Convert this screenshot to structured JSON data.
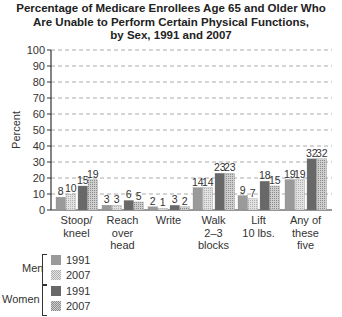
{
  "chart_data": {
    "type": "bar",
    "title": "Percentage of Medicare Enrollees Age 65 and Older Who Are Unable to Perform Certain Physical Functions, by Sex, 1991 and 2007",
    "title_lines": [
      "Percentage of Medicare Enrollees Age 65 and Older Who",
      "Are Unable to Perform Certain Physical Functions,",
      "by Sex, 1991 and 2007"
    ],
    "xlabel": "",
    "ylabel": "Percent",
    "ylim": [
      0,
      100
    ],
    "yticks": [
      0,
      10,
      20,
      30,
      40,
      50,
      60,
      70,
      80,
      90,
      100
    ],
    "grid": true,
    "categories": [
      "Stoop/kneel",
      "Reach over head",
      "Write",
      "Walk 2–3 blocks",
      "Lift 10 lbs.",
      "Any of these five"
    ],
    "category_lines": [
      [
        "Stoop/",
        "kneel"
      ],
      [
        "Reach",
        "over",
        "head"
      ],
      [
        "Write"
      ],
      [
        "Walk",
        "2–3",
        "blocks"
      ],
      [
        "Lift",
        "10 lbs."
      ],
      [
        "Any of",
        "these",
        "five"
      ]
    ],
    "series": [
      {
        "name": "Men 1991",
        "group": "Men",
        "year": "1991",
        "values": [
          8,
          3,
          2,
          14,
          9,
          19
        ],
        "color": "#9a9a9a",
        "pattern": "solid"
      },
      {
        "name": "Men 2007",
        "group": "Men",
        "year": "2007",
        "values": [
          10,
          3,
          1,
          14,
          7,
          19
        ],
        "color": "#d4d4d4",
        "pattern": "grid"
      },
      {
        "name": "Women 1991",
        "group": "Women",
        "year": "1991",
        "values": [
          15,
          6,
          3,
          23,
          18,
          32
        ],
        "color": "#686868",
        "pattern": "solid"
      },
      {
        "name": "Women 2007",
        "group": "Women",
        "year": "2007",
        "values": [
          19,
          5,
          2,
          23,
          15,
          32
        ],
        "color": "#b4b4b4",
        "pattern": "grid"
      }
    ],
    "legend_position": "bottom-left"
  },
  "legend": {
    "men_label": "Men",
    "women_label": "Women",
    "men_1991": "1991",
    "men_2007": "2007",
    "women_1991": "1991",
    "women_2007": "2007"
  }
}
